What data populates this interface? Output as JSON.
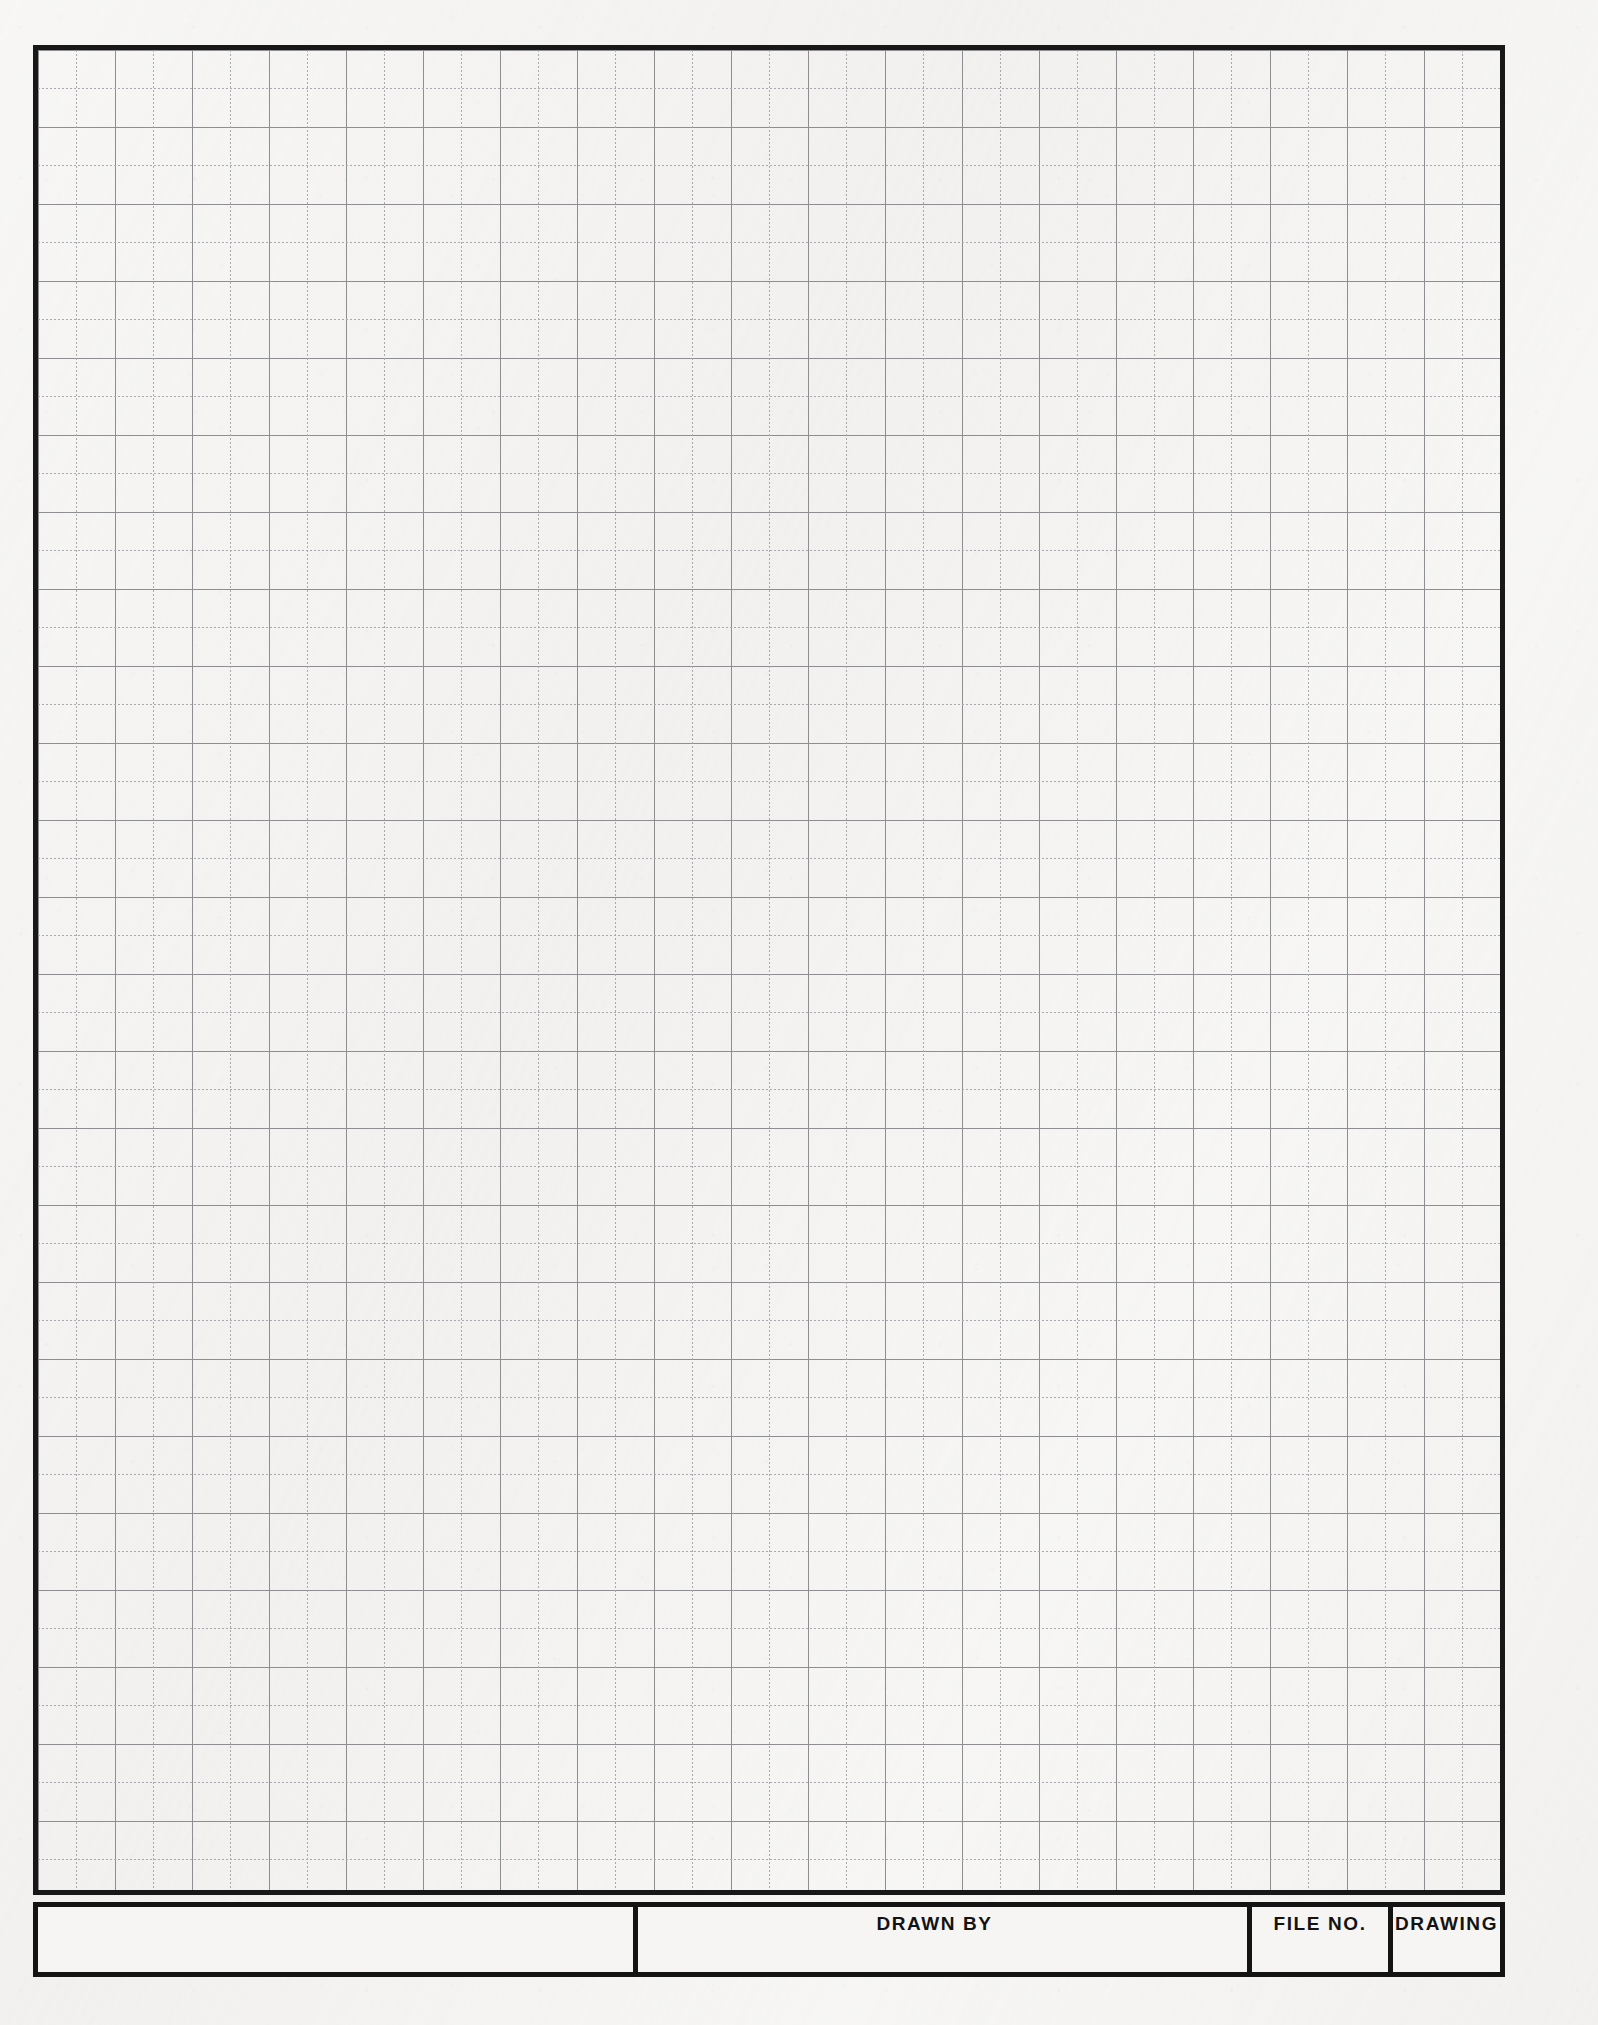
{
  "document": {
    "kind": "engineering-graph-paper-sheet",
    "paper_color": "#f3f2f0",
    "frame_color": "#181818"
  },
  "grid": {
    "major_line_color": "#8e8e90",
    "minor_line_color": "#a9a9ab",
    "major_spacing_px": 77,
    "minor_spacing_px": 38.5,
    "columns_major": 19,
    "rows_major": 24
  },
  "title_block": {
    "cells": [
      {
        "name": "blank",
        "label": ""
      },
      {
        "name": "drawn-by",
        "label": "DRAWN BY"
      },
      {
        "name": "file-no",
        "label": "FILE NO."
      },
      {
        "name": "drawing",
        "label": "DRAWING"
      }
    ]
  }
}
